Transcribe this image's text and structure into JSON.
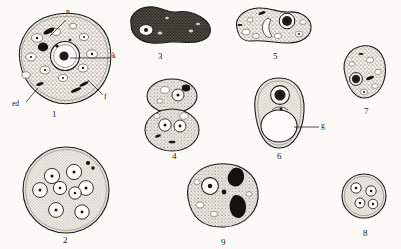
{
  "plate": {
    "title": "Protozoan cell plate",
    "background_color": "#fbfaf7",
    "ink_color": "#1c1a18",
    "stipple_color": "#6d6760",
    "figure_count": 9
  },
  "figures": [
    {
      "number": "1",
      "name": "large-trophozoite",
      "description": "Large rounded trophozoite with granular cytoplasm, many clear vacuoles and one prominent ring nucleus",
      "number_pos": {
        "x": 52,
        "y": 110
      },
      "center": {
        "x": 62,
        "y": 58
      },
      "size": {
        "w": 96,
        "h": 88
      }
    },
    {
      "number": "2",
      "name": "multinucleate-cyst",
      "description": "Round finely stippled cyst containing eight ring nuclei and a dark chromatoid granule",
      "number_pos": {
        "x": 63,
        "y": 236
      },
      "center": {
        "x": 66,
        "y": 190
      },
      "size": {
        "w": 92,
        "h": 88
      }
    },
    {
      "number": "3",
      "name": "dark-amoeboid-form",
      "description": "Darkly stained irregular amoeboid form with pseudopodium and single pale nucleus",
      "number_pos": {
        "x": 158,
        "y": 52
      },
      "center": {
        "x": 170,
        "y": 24
      },
      "size": {
        "w": 82,
        "h": 36
      }
    },
    {
      "number": "4",
      "name": "dividing-cell",
      "description": "Dividing cell in figure-eight form, two daughter masses each with nuclei",
      "number_pos": {
        "x": 172,
        "y": 152
      },
      "center": {
        "x": 172,
        "y": 114
      },
      "size": {
        "w": 56,
        "h": 66
      }
    },
    {
      "number": "5",
      "name": "elongate-trophozoite",
      "description": "Elongate trophozoite with dark ring nucleus and crescent-shaped inclusion",
      "number_pos": {
        "x": 273,
        "y": 52
      },
      "center": {
        "x": 274,
        "y": 25
      },
      "size": {
        "w": 76,
        "h": 38
      }
    },
    {
      "number": "6",
      "name": "vacuolated-cell",
      "description": "Oval cell with dark nucleus above and a very large clear vacuole labelled g",
      "number_pos": {
        "x": 277,
        "y": 152
      },
      "center": {
        "x": 279,
        "y": 113
      },
      "size": {
        "w": 52,
        "h": 72
      }
    },
    {
      "number": "7",
      "name": "pear-shaped-cell",
      "description": "Pear-shaped cell with solid dark nucleus and coarse granular cytoplasm",
      "number_pos": {
        "x": 364,
        "y": 107
      },
      "center": {
        "x": 365,
        "y": 72
      },
      "size": {
        "w": 48,
        "h": 58
      }
    },
    {
      "number": "8",
      "name": "quadrinucleate-cyst",
      "description": "Small round cyst containing four ring nuclei",
      "number_pos": {
        "x": 363,
        "y": 229
      },
      "center": {
        "x": 364,
        "y": 196
      },
      "size": {
        "w": 46,
        "h": 46
      }
    },
    {
      "number": "9",
      "name": "cell-with-ingesta",
      "description": "Rounded cell with one ring nucleus and two large dark ingested masses",
      "number_pos": {
        "x": 221,
        "y": 238
      },
      "center": {
        "x": 223,
        "y": 196
      },
      "size": {
        "w": 74,
        "h": 66
      }
    }
  ],
  "anatomical_labels": [
    {
      "key": "n",
      "text": "n",
      "name": "nucleus-label",
      "figure": "1",
      "text_pos": {
        "x": 66,
        "y": 12
      },
      "leader": {
        "x1": 66,
        "y1": 20,
        "x2": 50,
        "y2": 36
      }
    },
    {
      "key": "k",
      "text": "k",
      "name": "karyosome-label",
      "figure": "1",
      "text_pos": {
        "x": 112,
        "y": 55
      },
      "leader": {
        "x1": 110,
        "y1": 58,
        "x2": 70,
        "y2": 58
      }
    },
    {
      "key": "f",
      "text": "f",
      "name": "food-vacuole-label",
      "figure": "1",
      "text_pos": {
        "x": 104,
        "y": 96
      },
      "leader": {
        "x1": 103,
        "y1": 95,
        "x2": 88,
        "y2": 80
      }
    },
    {
      "key": "ed",
      "text": "ed",
      "name": "ectoplasm-label",
      "figure": "1",
      "text_pos": {
        "x": 12,
        "y": 103
      },
      "leader": {
        "x1": 26,
        "y1": 102,
        "x2": 38,
        "y2": 88
      }
    },
    {
      "key": "g",
      "text": "g",
      "name": "glycogen-vacuole-label",
      "figure": "6",
      "text_pos": {
        "x": 321,
        "y": 125
      },
      "leader": {
        "x1": 319,
        "y1": 127,
        "x2": 294,
        "y2": 127
      }
    }
  ]
}
